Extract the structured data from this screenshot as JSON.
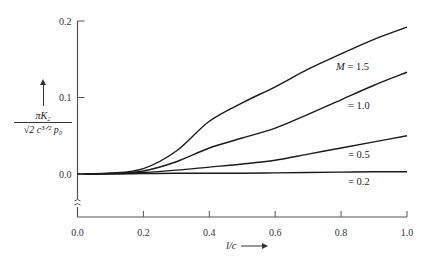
{
  "chart_data": {
    "type": "line",
    "title": "",
    "xlabel": "l/c",
    "ylabel_numerator": "πK₂",
    "ylabel_denominator": "√2 c^{3/2} p₀",
    "xlim": [
      0.0,
      1.0
    ],
    "ylim": [
      0.0,
      0.2
    ],
    "x_ticks": [
      "0.0",
      "0.2",
      "0.4",
      "0.6",
      "0.8",
      "1.0"
    ],
    "y_ticks": [
      "0.0",
      "0.1",
      "0.2"
    ],
    "grid": false,
    "legend": "inline labels at right end of curves",
    "y_axis_break": true,
    "x": [
      0.0,
      0.1,
      0.2,
      0.3,
      0.4,
      0.5,
      0.6,
      0.7,
      0.8,
      0.9,
      1.0
    ],
    "series": [
      {
        "name": "M = 1.5",
        "label": "M = 1.5",
        "values": [
          0.0,
          0.001,
          0.007,
          0.03,
          0.069,
          0.093,
          0.114,
          0.137,
          0.157,
          0.176,
          0.192
        ]
      },
      {
        "name": "M = 1.0",
        "label": "= 1.0",
        "values": [
          0.0,
          0.001,
          0.004,
          0.016,
          0.034,
          0.047,
          0.06,
          0.078,
          0.097,
          0.116,
          0.133
        ]
      },
      {
        "name": "M = 0.5",
        "label": "= 0.5",
        "values": [
          0.0,
          0.0005,
          0.002,
          0.005,
          0.009,
          0.013,
          0.018,
          0.026,
          0.034,
          0.042,
          0.05
        ]
      },
      {
        "name": "M = 0.2",
        "label": "= 0.2",
        "values": [
          0.0,
          0.0,
          0.0005,
          0.001,
          0.001,
          0.001,
          0.0015,
          0.002,
          0.0025,
          0.003,
          0.003
        ]
      }
    ]
  },
  "labels": {
    "xaxis": "l/c",
    "ylabel_num": "πK₂",
    "ylabel_den": "√2 c³ᐟ² p₀"
  }
}
